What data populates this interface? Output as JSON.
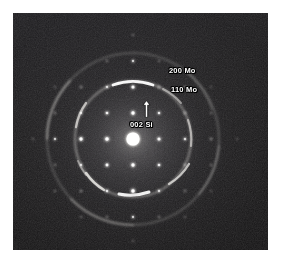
{
  "figure": {
    "kind": "electron-diffraction-pattern",
    "technique": "selected-area electron diffraction (SAED)",
    "page_background": "#ffffff",
    "plate_background": "#141314",
    "plate": {
      "x": 13,
      "y": 13,
      "width": 255,
      "height": 237
    }
  },
  "annotations": [
    {
      "id": "200mo",
      "label": "200 Mo",
      "x": 156,
      "y": 53,
      "target": "outer-ring"
    },
    {
      "id": "110mo",
      "label": "110 Mo",
      "x": 158,
      "y": 72,
      "target": "inner-ring"
    },
    {
      "id": "002si",
      "label": "002 Si",
      "x": 117,
      "y": 107,
      "target": "si-spot",
      "arrow": "up"
    }
  ],
  "icons": {
    "arrow_up": "arrow-up-icon"
  },
  "chart_data": {
    "type": "scatter",
    "xlabel": "",
    "ylabel": "",
    "grid": false,
    "legend": "none",
    "xlim": [
      0,
      255
    ],
    "ylim": [
      0,
      237
    ],
    "center": {
      "x": 120,
      "y": 126
    },
    "direct_beam": {
      "x": 120,
      "y": 126,
      "radius": 9.5,
      "intensity": 1.0,
      "label": "000 transmitted beam"
    },
    "rings": [
      {
        "name": "110 Mo",
        "radius": 58,
        "intensity": 0.72,
        "width": 2.2,
        "description": "inner polycrystalline Mo ring with bright textured arcs",
        "arcs_deg": [
          [
            72,
            108
          ],
          [
            250,
            290
          ],
          [
            160,
            200
          ],
          [
            340,
            20
          ],
          [
            120,
            140
          ],
          [
            200,
            232
          ]
        ]
      },
      {
        "name": "200 Mo",
        "radius": 86,
        "intensity": 0.38,
        "width": 2.0,
        "description": "outer diffuse polycrystalline Mo ring",
        "arcs_deg": [
          [
            140,
            215
          ],
          [
            300,
            355
          ],
          [
            40,
            80
          ]
        ]
      }
    ],
    "lattice": {
      "name": "Si single-crystal spots",
      "spacing_px": 25.5,
      "rotation_deg": 0,
      "spots": [
        {
          "x": 120,
          "y": 126,
          "r": 9.5,
          "i": 1.0,
          "label": "000"
        },
        {
          "x": 120,
          "y": 100,
          "r": 3.4,
          "i": 0.78,
          "label": "002 Si"
        },
        {
          "x": 120,
          "y": 152,
          "r": 3.4,
          "i": 0.74,
          "label": "00-2"
        },
        {
          "x": 94,
          "y": 126,
          "r": 3.6,
          "i": 0.8,
          "label": "-200"
        },
        {
          "x": 146,
          "y": 126,
          "r": 3.2,
          "i": 0.6,
          "label": "200"
        },
        {
          "x": 94,
          "y": 100,
          "r": 2.8,
          "i": 0.62,
          "label": "-202"
        },
        {
          "x": 146,
          "y": 100,
          "r": 2.6,
          "i": 0.55,
          "label": "202"
        },
        {
          "x": 94,
          "y": 152,
          "r": 3.0,
          "i": 0.66,
          "label": "-20-2"
        },
        {
          "x": 146,
          "y": 152,
          "r": 2.8,
          "i": 0.58,
          "label": "20-2"
        },
        {
          "x": 120,
          "y": 74,
          "r": 3.2,
          "i": 0.68,
          "label": "004"
        },
        {
          "x": 120,
          "y": 178,
          "r": 3.6,
          "i": 0.76,
          "label": "00-4"
        },
        {
          "x": 68,
          "y": 126,
          "r": 3.4,
          "i": 0.7,
          "label": "-400"
        },
        {
          "x": 172,
          "y": 126,
          "r": 2.6,
          "i": 0.48,
          "label": "400"
        },
        {
          "x": 68,
          "y": 100,
          "r": 2.4,
          "i": 0.45,
          "label": "-402"
        },
        {
          "x": 172,
          "y": 100,
          "r": 2.2,
          "i": 0.4,
          "label": "402"
        },
        {
          "x": 68,
          "y": 152,
          "r": 2.4,
          "i": 0.46,
          "label": "-40-2"
        },
        {
          "x": 172,
          "y": 152,
          "r": 2.2,
          "i": 0.42,
          "label": "40-2"
        },
        {
          "x": 94,
          "y": 74,
          "r": 2.4,
          "i": 0.46,
          "label": "-204"
        },
        {
          "x": 146,
          "y": 74,
          "r": 2.2,
          "i": 0.42,
          "label": "204"
        },
        {
          "x": 94,
          "y": 178,
          "r": 2.6,
          "i": 0.5,
          "label": "-20-4"
        },
        {
          "x": 146,
          "y": 178,
          "r": 2.4,
          "i": 0.46,
          "label": "20-4"
        },
        {
          "x": 120,
          "y": 48,
          "r": 2.4,
          "i": 0.44,
          "label": "006"
        },
        {
          "x": 120,
          "y": 204,
          "r": 2.4,
          "i": 0.44,
          "label": "00-6"
        },
        {
          "x": 42,
          "y": 126,
          "r": 2.4,
          "i": 0.44,
          "label": "-600"
        },
        {
          "x": 198,
          "y": 126,
          "r": 2.0,
          "i": 0.34,
          "label": "600"
        },
        {
          "x": 68,
          "y": 74,
          "r": 2.0,
          "i": 0.34,
          "label": "-404"
        },
        {
          "x": 172,
          "y": 74,
          "r": 1.8,
          "i": 0.3,
          "label": "404"
        },
        {
          "x": 68,
          "y": 178,
          "r": 2.0,
          "i": 0.34,
          "label": "-40-4"
        },
        {
          "x": 172,
          "y": 178,
          "r": 1.8,
          "i": 0.3,
          "label": "40-4"
        },
        {
          "x": 42,
          "y": 100,
          "r": 1.8,
          "i": 0.28,
          "label": "-602"
        },
        {
          "x": 42,
          "y": 152,
          "r": 1.8,
          "i": 0.28,
          "label": "-60-2"
        },
        {
          "x": 198,
          "y": 100,
          "r": 1.6,
          "i": 0.24,
          "label": "602"
        },
        {
          "x": 198,
          "y": 152,
          "r": 1.6,
          "i": 0.24,
          "label": "60-2"
        },
        {
          "x": 94,
          "y": 204,
          "r": 1.8,
          "i": 0.28,
          "label": "-20-6"
        },
        {
          "x": 146,
          "y": 204,
          "r": 1.8,
          "i": 0.28,
          "label": "20-6"
        },
        {
          "x": 94,
          "y": 48,
          "r": 1.8,
          "i": 0.26,
          "label": "-206"
        },
        {
          "x": 146,
          "y": 48,
          "r": 1.6,
          "i": 0.24,
          "label": "206"
        },
        {
          "x": 68,
          "y": 204,
          "r": 1.6,
          "i": 0.22,
          "label": "-40-6"
        },
        {
          "x": 172,
          "y": 204,
          "r": 1.5,
          "i": 0.2,
          "label": "40-6"
        },
        {
          "x": 42,
          "y": 74,
          "r": 1.5,
          "i": 0.2,
          "label": "-604"
        },
        {
          "x": 42,
          "y": 178,
          "r": 1.6,
          "i": 0.22,
          "label": "-60-4"
        },
        {
          "x": 198,
          "y": 74,
          "r": 1.4,
          "i": 0.18,
          "label": "604"
        },
        {
          "x": 198,
          "y": 178,
          "r": 1.4,
          "i": 0.18,
          "label": "60-4"
        },
        {
          "x": 120,
          "y": 22,
          "r": 1.6,
          "i": 0.22,
          "label": "008"
        },
        {
          "x": 120,
          "y": 228,
          "r": 1.5,
          "i": 0.2,
          "label": "00-8"
        },
        {
          "x": 20,
          "y": 126,
          "r": 1.5,
          "i": 0.2,
          "label": "-800"
        },
        {
          "x": 224,
          "y": 126,
          "r": 1.4,
          "i": 0.18,
          "label": "800"
        }
      ]
    }
  }
}
